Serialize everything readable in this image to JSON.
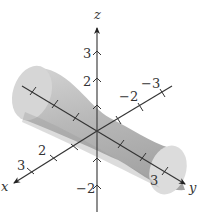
{
  "figure": {
    "surface_color": "#c9c9c9",
    "surface_shade": "#a8a8a8",
    "axis_color": "#333333"
  },
  "axes": {
    "x": {
      "name": "x",
      "tick_labels": [
        "2",
        "3"
      ]
    },
    "y": {
      "name": "y",
      "tick_labels": [
        "-2",
        "-3",
        "3"
      ]
    },
    "z": {
      "name": "z",
      "tick_labels": [
        "3",
        "2",
        "-2"
      ]
    }
  }
}
